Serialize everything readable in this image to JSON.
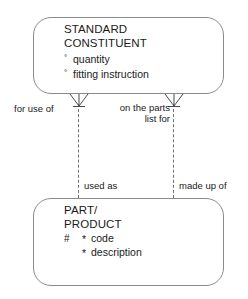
{
  "diagram": {
    "type": "entity-relationship-diagram",
    "notation": "barker",
    "entities": [
      {
        "id": "standard-constituent",
        "name_lines": [
          "STANDARD",
          "CONSTITUENT"
        ],
        "attributes": [
          {
            "marker": "°",
            "marker_kind": "optional",
            "name": "quantity"
          },
          {
            "marker": "°",
            "marker_kind": "optional",
            "name": "fitting instruction"
          }
        ]
      },
      {
        "id": "part-product",
        "name_lines": [
          "PART/",
          "PRODUCT"
        ],
        "attributes": [
          {
            "pk": "#",
            "marker": "*",
            "marker_kind": "mandatory",
            "name": "code"
          },
          {
            "pk": "",
            "marker": "*",
            "marker_kind": "mandatory",
            "name": "description"
          }
        ]
      }
    ],
    "relationships": [
      {
        "id": "for-use-of",
        "label": "for use of",
        "end_top": "many",
        "line_style": "dashed"
      },
      {
        "id": "on-the-parts-list-for",
        "label": "on the parts list for",
        "label_line1": "on the parts",
        "label_line2": "list for",
        "end_top": "many",
        "line_style": "dashed"
      },
      {
        "id": "used-as",
        "label": "used as",
        "line_style": "dashed"
      },
      {
        "id": "made-up-of",
        "label": "made up of",
        "line_style": "dashed"
      }
    ]
  },
  "colors": {
    "background": "#ffffff",
    "box_border": "#8a8a8a",
    "line": "#6e6e6e",
    "text": "#1a1a1a"
  }
}
